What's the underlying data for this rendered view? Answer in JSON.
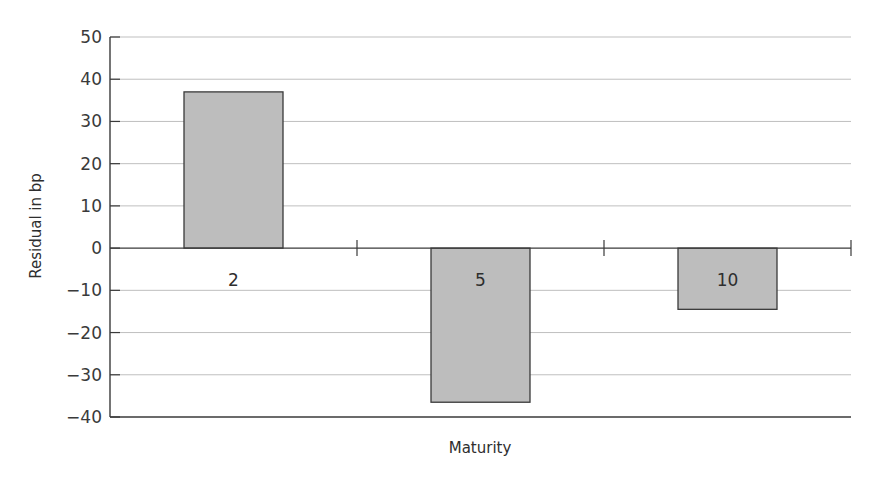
{
  "chart_data": {
    "type": "bar",
    "title": "",
    "xlabel": "Maturity",
    "ylabel": "Residual in bp",
    "categories": [
      "2",
      "5",
      "10"
    ],
    "values": [
      37,
      -36.5,
      -14.5
    ],
    "ylim": [
      -40,
      50
    ],
    "yticks": [
      50,
      40,
      30,
      20,
      10,
      0,
      -10,
      -20,
      -30,
      -40
    ],
    "ytick_labels": [
      "50",
      "40",
      "30",
      "20",
      "10",
      "0",
      "−10",
      "−20",
      "−30",
      "−40"
    ],
    "grid": true,
    "legend": null,
    "bar_color": "#bdbdbd",
    "bar_edge_color": "#3a3a3a",
    "grid_color": "#bfbfbf",
    "axis_color": "#3a3a3a"
  }
}
